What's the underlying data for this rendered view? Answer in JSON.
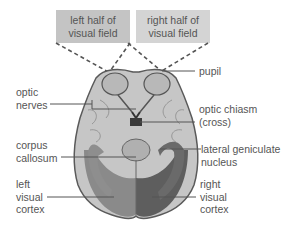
{
  "field_boxes": {
    "left": [
      "left half of",
      "visual field"
    ],
    "right": [
      "right half of",
      "visual field"
    ]
  },
  "labels": {
    "pupil": "pupil",
    "optic_nerves": [
      "optic",
      "nerves"
    ],
    "optic_chiasm": [
      "optic chiasm",
      "(cross)"
    ],
    "corpus_callosum": [
      "corpus",
      "callosum"
    ],
    "lateral_geniculate_nucleus": [
      "lateral geniculate",
      "nucleus"
    ],
    "left_visual_cortex": [
      "left",
      "visual",
      "cortex"
    ],
    "right_visual_cortex": [
      "right",
      "visual",
      "cortex"
    ]
  },
  "colors": {
    "left_box": "#c4c4c4",
    "right_box": "#d4d4d4",
    "brain_light": "#c8c8c8",
    "brain_dark": "#6e6e6e",
    "line": "#555555"
  }
}
